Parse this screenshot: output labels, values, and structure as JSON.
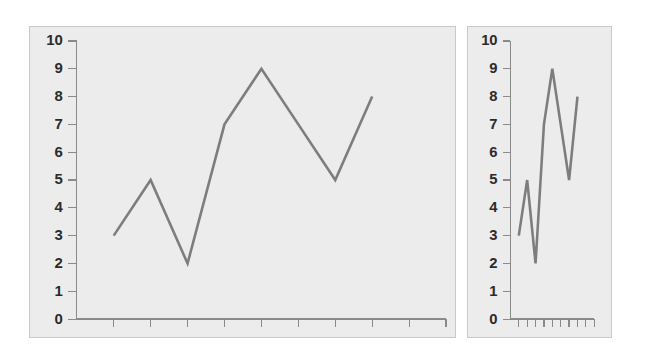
{
  "figure": {
    "background_color": "#ffffff",
    "panel_background_color": "#ececec",
    "panel_border_color": "#c9c9c9",
    "line_color": "#7d7d7d",
    "axis_color": "#8a8a8a",
    "label_color": "#2b2b2b"
  },
  "chart_data": [
    {
      "type": "line",
      "name": "wide-aspect-line-chart",
      "title": "",
      "subtitle": "",
      "xlabel": "",
      "ylabel": "",
      "x": [
        1,
        2,
        3,
        4,
        5,
        6,
        7,
        8
      ],
      "values": [
        3,
        5,
        2,
        7,
        9,
        7,
        5,
        8
      ],
      "categories": [
        "1",
        "2",
        "3",
        "4",
        "5",
        "6",
        "7",
        "8"
      ],
      "ylim": [
        0,
        10
      ],
      "xlim": [
        0,
        10
      ],
      "ytick_labels": [
        "0",
        "1",
        "2",
        "3",
        "4",
        "5",
        "6",
        "7",
        "8",
        "9",
        "10"
      ],
      "ytick_values": [
        0,
        1,
        2,
        3,
        4,
        5,
        6,
        7,
        8,
        9,
        10
      ],
      "xtick_labels": [
        "",
        "",
        "",
        "",
        "",
        "",
        "",
        "",
        "",
        ""
      ],
      "xtick_count": 10,
      "grid": false,
      "legend": false,
      "legend_position": "none",
      "annotations": [],
      "aspect": "wide"
    },
    {
      "type": "line",
      "name": "narrow-aspect-line-chart",
      "title": "",
      "subtitle": "",
      "xlabel": "",
      "ylabel": "",
      "x": [
        1,
        2,
        3,
        4,
        5,
        6,
        7,
        8
      ],
      "values": [
        3,
        5,
        2,
        7,
        9,
        7,
        5,
        8
      ],
      "categories": [
        "1",
        "2",
        "3",
        "4",
        "5",
        "6",
        "7",
        "8"
      ],
      "ylim": [
        0,
        10
      ],
      "xlim": [
        0,
        10
      ],
      "ytick_labels": [
        "0",
        "1",
        "2",
        "3",
        "4",
        "5",
        "6",
        "7",
        "8",
        "9",
        "10"
      ],
      "ytick_values": [
        0,
        1,
        2,
        3,
        4,
        5,
        6,
        7,
        8,
        9,
        10
      ],
      "xtick_labels": [
        "",
        "",
        "",
        "",
        "",
        "",
        "",
        "",
        "",
        ""
      ],
      "xtick_count": 10,
      "grid": false,
      "legend": false,
      "legend_position": "none",
      "annotations": [],
      "aspect": "narrow"
    }
  ]
}
